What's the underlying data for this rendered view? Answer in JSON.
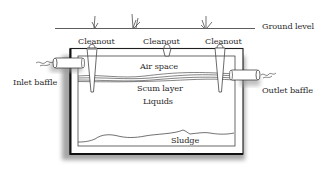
{
  "diagram": {
    "labels": {
      "ground_level": "Ground level",
      "cleanout_left": "Cleanout",
      "cleanout_middle": "Cleanout",
      "cleanout_right": "Cleanout",
      "inlet_baffle": "Inlet baffle",
      "outlet_baffle": "Outlet baffle",
      "air_space": "Air space",
      "scum_layer": "Scum layer",
      "liquids": "Liquids",
      "sludge": "Sludge"
    },
    "colors": {
      "line": "#2a2a2a",
      "tank_wall": "#1e1e1e",
      "shadow": "#9a9a9a",
      "background": "#ffffff"
    }
  }
}
